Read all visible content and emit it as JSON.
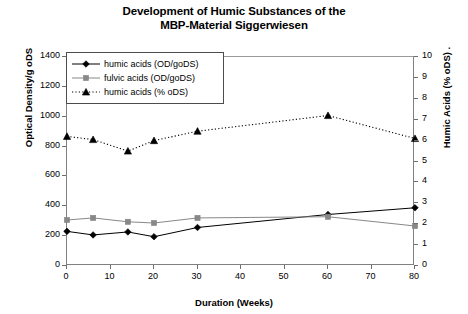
{
  "chart_data": {
    "type": "line",
    "title": "Development of Humic Substances of the MBP-Material Siggerwiesen",
    "title_line1": "Development of Humic Substances of the",
    "title_line2": "MBP-Material Siggerwiesen",
    "xlabel": "Duration (Weeks)",
    "ylabel": "Optical Density/g oDS",
    "ylabel_right": "Humic Acids (% oDS) .",
    "xlim": [
      0,
      80
    ],
    "ylim": [
      0,
      1400
    ],
    "ylim_right": [
      0,
      10
    ],
    "xticks": [
      0,
      10,
      20,
      30,
      40,
      50,
      60,
      70,
      80
    ],
    "yticks": [
      0,
      200,
      400,
      600,
      800,
      1000,
      1200,
      1400
    ],
    "yticks_right": [
      0,
      1,
      2,
      3,
      4,
      5,
      6,
      7,
      8,
      9,
      10
    ],
    "grid": false,
    "legend_position": "upper-left-inside",
    "x": [
      0,
      6,
      14,
      20,
      30,
      60,
      80
    ],
    "series": [
      {
        "name": "humic acids (OD/goDS)",
        "axis": "left",
        "marker": "diamond",
        "linestyle": "solid",
        "color": "#000000",
        "values": [
          232,
          208,
          228,
          196,
          258,
          345,
          390
        ]
      },
      {
        "name": "fulvic acids (OD/goDS)",
        "axis": "left",
        "marker": "square",
        "linestyle": "solid",
        "color": "#888888",
        "values": [
          308,
          322,
          296,
          288,
          322,
          330,
          268
        ]
      },
      {
        "name": "humic acids (% oDS)",
        "axis": "right",
        "marker": "triangle",
        "linestyle": "dotted",
        "color": "#000000",
        "values": [
          6.2,
          6.05,
          5.5,
          6.0,
          6.45,
          7.2,
          6.1
        ]
      }
    ]
  },
  "legend": {
    "items": [
      {
        "label": "humic acids (OD/goDS)",
        "marker": "diamond",
        "linestyle": "solid"
      },
      {
        "label": "fulvic acids (OD/goDS)",
        "marker": "square",
        "linestyle": "solid"
      },
      {
        "label": "humic acids (% oDS)",
        "marker": "triangle",
        "linestyle": "dotted"
      }
    ]
  }
}
